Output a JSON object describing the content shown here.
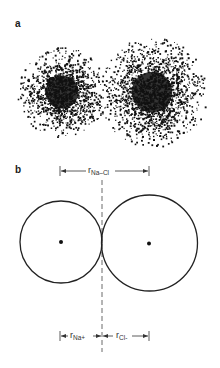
{
  "panels": {
    "a": {
      "label": "a",
      "description": "electron density clouds of Na+ and Cl- ions"
    },
    "b": {
      "label": "b",
      "description": "hard-sphere model of Na+ and Cl- ions in contact"
    }
  },
  "dimensions": {
    "top": {
      "symbol": "r",
      "subscript": "Na–Cl"
    },
    "bottom_left": {
      "symbol": "r",
      "subscript": "Na+"
    },
    "bottom_right": {
      "symbol": "r",
      "subscript": "Cl-"
    }
  },
  "geometry": {
    "cloud_left": {
      "cx": 62,
      "cy": 92,
      "r": 45,
      "core": 22,
      "n": 1400
    },
    "cloud_right": {
      "cx": 152,
      "cy": 92,
      "r": 55,
      "core": 27,
      "n": 1900
    },
    "circle_left": {
      "cx": 61,
      "cy": 242,
      "r": 41
    },
    "circle_right": {
      "cx": 149.5,
      "cy": 243,
      "r": 48
    },
    "divider_x": 102
  },
  "colors": {
    "ink": "#1a1a1a",
    "background": "#ffffff"
  }
}
